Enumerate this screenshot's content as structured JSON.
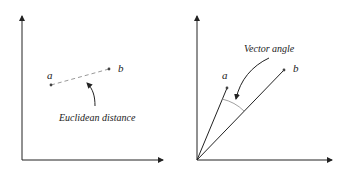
{
  "panels": [
    {
      "id": "euclidean",
      "point_a_label": "a",
      "point_b_label": "b",
      "caption": "Euclidean distance"
    },
    {
      "id": "vector-angle",
      "point_a_label": "a",
      "point_b_label": "b",
      "caption": "Vector angle"
    }
  ],
  "colors": {
    "line": "#222222",
    "dashed": "#999999",
    "arc": "#888888"
  }
}
